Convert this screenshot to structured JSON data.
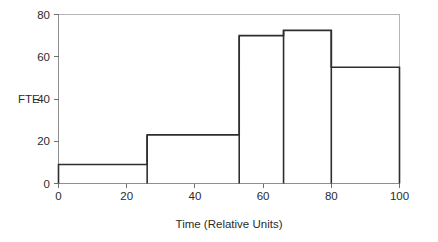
{
  "chart_data": {
    "type": "bar",
    "title": "",
    "subtitle": "",
    "xlabel": "Time (Relative Units)",
    "ylabel": "FTE",
    "xlim": [
      0,
      100
    ],
    "ylim": [
      0,
      80
    ],
    "xticks": [
      0,
      20,
      40,
      60,
      80,
      100
    ],
    "yticks": [
      0,
      20,
      40,
      60,
      80
    ],
    "xtick_labels": [
      "0",
      "20",
      "40",
      "60",
      "80",
      "100"
    ],
    "ytick_labels": [
      "0",
      "20",
      "40",
      "60",
      "80"
    ],
    "grid": false,
    "legend": false,
    "legend_position": "none",
    "style": "step-histogram",
    "bin_edges": [
      0,
      26,
      53,
      66,
      80,
      100
    ],
    "categories": [
      "0-26",
      "26-53",
      "53-66",
      "66-80",
      "80-100"
    ],
    "values": [
      9,
      23,
      70,
      72.5,
      55
    ],
    "series": [
      {
        "name": "FTE",
        "values": [
          9,
          23,
          70,
          72.5,
          55
        ]
      }
    ],
    "bars": [
      {
        "x0": 0,
        "x1": 26,
        "value": 9
      },
      {
        "x0": 26,
        "x1": 53,
        "value": 23
      },
      {
        "x0": 53,
        "x1": 66,
        "value": 70
      },
      {
        "x0": 66,
        "x1": 80,
        "value": 72.5
      },
      {
        "x0": 80,
        "x1": 100,
        "value": 55
      }
    ],
    "annotations": [],
    "colors": {
      "outline": "#2e2e2e",
      "frame": "#b5b5b5",
      "axis": "#8f8f8f",
      "text": "#2b2b2b",
      "background": "#ffffff"
    }
  }
}
